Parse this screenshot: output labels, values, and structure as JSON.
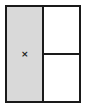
{
  "diagram": {
    "type": "panel-layout",
    "panes": [
      {
        "id": "left",
        "fill": "#d9d9d9",
        "marker": "×"
      },
      {
        "id": "right-top",
        "fill": "#ffffff"
      },
      {
        "id": "right-bottom",
        "fill": "#ffffff"
      }
    ],
    "border_color": "#1a1a1a"
  }
}
